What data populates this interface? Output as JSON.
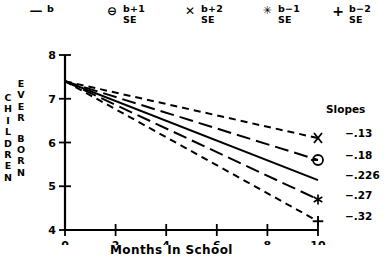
{
  "legend": {
    "items": [
      {
        "marker": "dash-marker",
        "marker_glyph": "—",
        "line1": "b",
        "line2": ""
      },
      {
        "marker": "circle-minus-marker",
        "marker_glyph": "⊖",
        "line1": "b+1",
        "line2": "SE"
      },
      {
        "marker": "x-cross-marker",
        "marker_glyph": "✕",
        "line1": "b+2",
        "line2": "SE"
      },
      {
        "marker": "asterisk-marker",
        "marker_glyph": "✳",
        "line1": "b−1",
        "line2": "SE"
      },
      {
        "marker": "plus-marker",
        "marker_glyph": "+",
        "line1": "b−2",
        "line2": "SE"
      }
    ]
  },
  "slopes_panel": {
    "title": "Slopes",
    "values": [
      "−.13",
      "−.18",
      "−.226",
      "−.27",
      "−.32"
    ]
  },
  "axis": {
    "ylabel_col1": [
      "C",
      "H",
      "I",
      "L",
      "D",
      "R",
      "E",
      "N"
    ],
    "ylabel_col2": [
      "E",
      "V",
      "E",
      "R"
    ],
    "ylabel_col3": [
      "B",
      "O",
      "R",
      "N"
    ],
    "xlabel": "Months In School",
    "yticks": [
      "8",
      "7",
      "6",
      "5",
      "4"
    ],
    "xticks": [
      "0",
      "2",
      "4",
      "6",
      "8",
      "10"
    ]
  },
  "chart_data": {
    "type": "line",
    "title": "",
    "xlabel": "Months In School",
    "ylabel": "CHILDREN EVER BORN",
    "xlim": [
      0,
      10
    ],
    "ylim": [
      4,
      8
    ],
    "xticks": [
      0,
      2,
      4,
      6,
      8,
      10
    ],
    "yticks": [
      4,
      5,
      6,
      7,
      8
    ],
    "grid": false,
    "legend_position": "top",
    "intercept": 7.4,
    "x": [
      0,
      10
    ],
    "series": [
      {
        "name": "b+2 SE",
        "slope": -0.13,
        "marker": "x-cross-marker",
        "dash": "short-dash",
        "values": [
          7.4,
          6.1
        ],
        "slope_label": "−.13"
      },
      {
        "name": "b+1 SE",
        "slope": -0.18,
        "marker": "circle-minus-marker",
        "dash": "long-dash",
        "values": [
          7.4,
          5.6
        ],
        "slope_label": "−.18"
      },
      {
        "name": "b",
        "slope": -0.226,
        "marker": "none",
        "dash": "solid",
        "values": [
          7.4,
          5.14
        ],
        "slope_label": "−.226"
      },
      {
        "name": "b−1 SE",
        "slope": -0.27,
        "marker": "asterisk-marker",
        "dash": "long-dash",
        "values": [
          7.4,
          4.7
        ],
        "slope_label": "−.27"
      },
      {
        "name": "b−2 SE",
        "slope": -0.32,
        "marker": "plus-marker",
        "dash": "short-dash",
        "values": [
          7.4,
          4.2
        ],
        "slope_label": "−.32"
      }
    ]
  }
}
